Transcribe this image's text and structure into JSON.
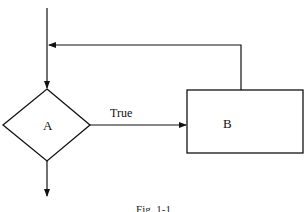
{
  "diagram": {
    "type": "flowchart-while-loop",
    "stroke_color": "#111111",
    "background": "#ffffff",
    "nodes": [
      {
        "id": "A",
        "shape": "diamond",
        "label": "A"
      },
      {
        "id": "B",
        "shape": "rectangle",
        "label": "B"
      }
    ],
    "edges": [
      {
        "from": "entry",
        "to": "A",
        "label": ""
      },
      {
        "from": "A",
        "to": "B",
        "label": "True"
      },
      {
        "from": "B",
        "to": "A",
        "label": "",
        "kind": "loop-back"
      },
      {
        "from": "A",
        "to": "exit",
        "label": ""
      }
    ],
    "labels": {
      "node_a": "A",
      "node_b": "B",
      "edge_true": "True"
    },
    "caption": "Fig. 1-1"
  }
}
